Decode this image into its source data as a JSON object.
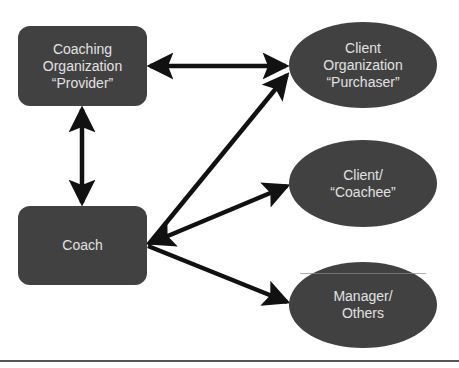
{
  "diagram": {
    "type": "relationship-diagram",
    "fill_color": "#414141",
    "text_color": "#e2e2e2",
    "arrow_color": "#111111",
    "nodes": [
      {
        "id": "provider",
        "shape": "rounded-rect",
        "lines": [
          "Coaching",
          "Organization",
          "“Provider”"
        ]
      },
      {
        "id": "coach",
        "shape": "rounded-rect",
        "lines": [
          "Coach"
        ]
      },
      {
        "id": "purchaser",
        "shape": "ellipse",
        "lines": [
          "Client",
          "Organization",
          "“Purchaser”"
        ]
      },
      {
        "id": "coachee",
        "shape": "ellipse",
        "lines": [
          "Client/",
          "“Coachee”"
        ]
      },
      {
        "id": "manager",
        "shape": "ellipse",
        "lines": [
          "Manager/",
          "Others"
        ]
      }
    ],
    "edges": [
      {
        "from": "provider",
        "to": "purchaser",
        "direction": "both"
      },
      {
        "from": "provider",
        "to": "coach",
        "direction": "both"
      },
      {
        "from": "coach",
        "to": "purchaser",
        "direction": "forward"
      },
      {
        "from": "coach",
        "to": "coachee",
        "direction": "both"
      },
      {
        "from": "coach",
        "to": "manager",
        "direction": "forward"
      }
    ]
  }
}
